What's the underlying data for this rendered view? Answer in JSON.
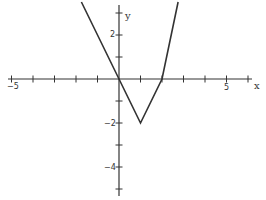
{
  "chart_data": {
    "type": "line",
    "title": "",
    "xlabel": "x",
    "ylabel": "y",
    "xlim": [
      -5,
      6
    ],
    "ylim": [
      -5,
      3.5
    ],
    "x_ticks": [
      -5,
      -4,
      -3,
      -2,
      -1,
      1,
      2,
      3,
      4,
      5,
      6
    ],
    "y_ticks": [
      -5,
      -4,
      -3,
      -2,
      -1,
      1,
      2,
      3
    ],
    "x_tick_labels": {
      "-5": "−5",
      "5": "5"
    },
    "y_tick_labels": {
      "2": "2",
      "-2": "−2",
      "-4": "−4"
    },
    "grid": false,
    "series": [
      {
        "name": "y = |2x - 2| - 2",
        "x": [
          -1.75,
          0,
          1,
          2,
          2.75
        ],
        "y": [
          3.5,
          0,
          -2,
          0,
          3.5
        ]
      }
    ],
    "vertex": [
      1,
      -2
    ]
  },
  "labels": {
    "x_axis": "x",
    "y_axis": "y",
    "x_minus5": "−5",
    "x_5": "5",
    "y_2": "2",
    "y_minus2": "−2",
    "y_minus4": "−4"
  }
}
